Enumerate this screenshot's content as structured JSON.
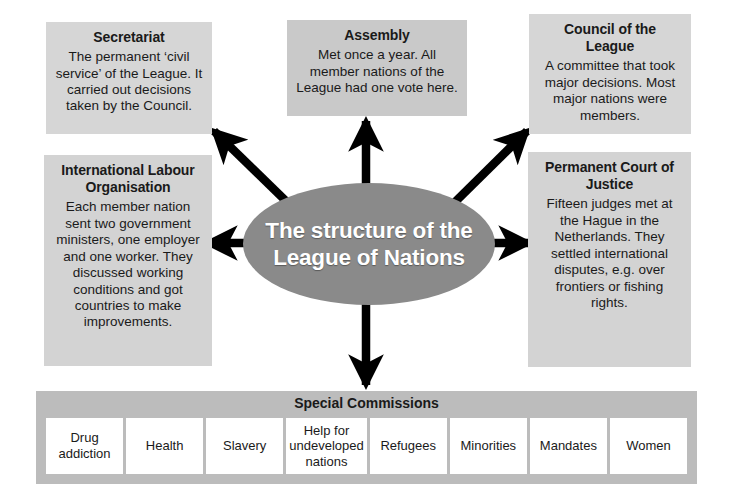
{
  "diagram": {
    "center": {
      "label": "The structure of the League of Nations",
      "line1": "The structure of the",
      "line2": "League of Nations",
      "fill_color": "#8a8a8a",
      "text_color": "#ffffff"
    },
    "boxes": [
      {
        "id": "secretariat",
        "title": "Secretariat",
        "body": "The permanent ‘civil service’ of the League. It carried out decisions taken by the Council.",
        "fill_color": "#d6d6d6"
      },
      {
        "id": "assembly",
        "title": "Assembly",
        "body": "Met once a year. All member nations of the League had one vote here.",
        "fill_color": "#c9c9c9"
      },
      {
        "id": "council",
        "title": "Council of the League",
        "body": "A committee that took major decisions. Most major nations were members.",
        "fill_color": "#d6d6d6"
      },
      {
        "id": "ilo",
        "title": "International Labour Organisation",
        "body": "Each member nation sent two government ministers, one employer and one worker. They discussed working conditions and got countries to make improvements.",
        "fill_color": "#d3d3d3"
      },
      {
        "id": "pcj",
        "title": "Permanent Court of Justice",
        "body": "Fifteen judges met at the Hague in the Netherlands. They settled international disputes, e.g. over frontiers or fishing rights.",
        "fill_color": "#d3d3d3"
      }
    ],
    "commissions": {
      "title": "Special Commissions",
      "bar_color": "#bcbcbc",
      "cells": [
        "Drug addiction",
        "Health",
        "Slavery",
        "Help for undeveloped nations",
        "Refugees",
        "Minorities",
        "Mandates",
        "Women"
      ]
    },
    "arrows": [
      {
        "id": "arrow-to-secretariat",
        "direction": "up-left"
      },
      {
        "id": "arrow-to-assembly",
        "direction": "up"
      },
      {
        "id": "arrow-to-council",
        "direction": "up-right"
      },
      {
        "id": "arrow-to-ilo",
        "direction": "left"
      },
      {
        "id": "arrow-to-pcj",
        "direction": "right"
      },
      {
        "id": "arrow-to-commissions",
        "direction": "down"
      }
    ],
    "arrow_color": "#000000"
  }
}
